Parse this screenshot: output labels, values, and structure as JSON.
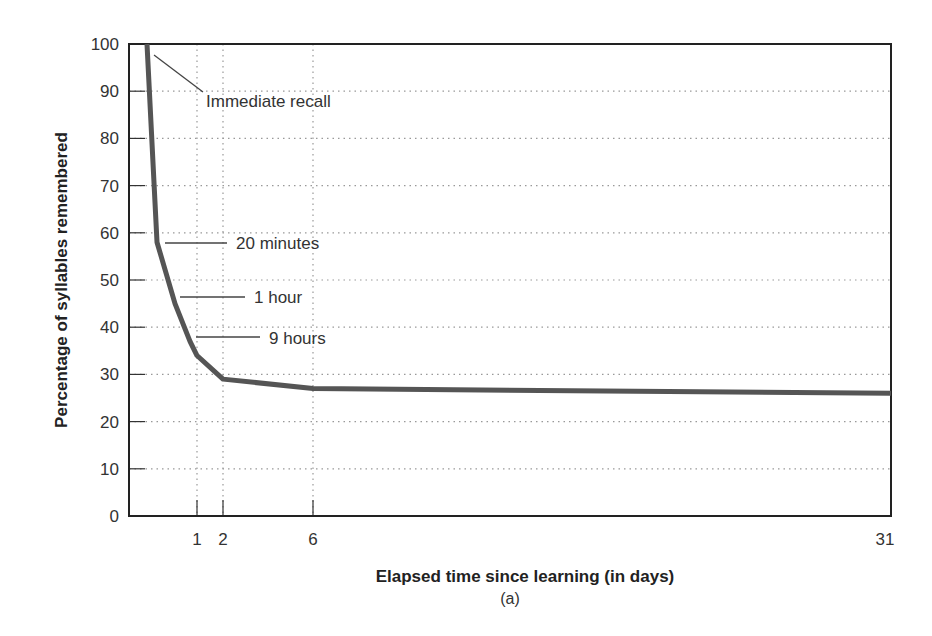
{
  "chart_data": {
    "type": "line",
    "title": "",
    "xlabel": "Elapsed time since learning (in days)",
    "ylabel": "Percentage of syllables remembered",
    "caption": "(a)",
    "ylim": [
      0,
      100
    ],
    "yticks": [
      "0",
      "10",
      "20",
      "30",
      "40",
      "50",
      "60",
      "70",
      "80",
      "90",
      "100"
    ],
    "xticks": [
      {
        "label": "1",
        "px": 197
      },
      {
        "label": "2",
        "px": 223
      },
      {
        "label": "6",
        "px": 313
      },
      {
        "label": "31",
        "px": 885
      }
    ],
    "grid": "dotted",
    "series": [
      {
        "name": "Ebbinghaus forgetting curve",
        "color": "#555555",
        "points": [
          {
            "t": "Immediate recall",
            "x_px": 147,
            "y": 100
          },
          {
            "t": "20 minutes",
            "x_px": 157,
            "y": 58
          },
          {
            "t": "1 hour",
            "x_px": 175,
            "y": 45
          },
          {
            "t": "9 hours",
            "x_px": 190,
            "y": 37
          },
          {
            "t": "1 day",
            "x_px": 197,
            "y": 34
          },
          {
            "t": "2 days",
            "x_px": 223,
            "y": 29
          },
          {
            "t": "6 days",
            "x_px": 313,
            "y": 27
          },
          {
            "t": "31 days",
            "x_px": 891,
            "y": 26
          }
        ]
      }
    ],
    "annotations": [
      {
        "label": "Immediate recall",
        "value": 100
      },
      {
        "label": "20 minutes",
        "value": 58
      },
      {
        "label": "1 hour",
        "value": 45
      },
      {
        "label": "9 hours",
        "value": 37
      }
    ]
  }
}
